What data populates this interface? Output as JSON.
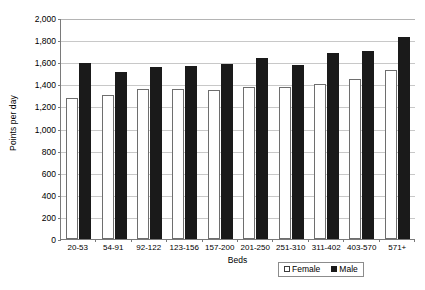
{
  "chart_data": {
    "type": "bar",
    "title": "",
    "xlabel": "Beds",
    "ylabel": "Points per day",
    "categories": [
      "20-53",
      "54-91",
      "92-122",
      "123-156",
      "157-200",
      "201-250",
      "251-310",
      "311-402",
      "403-570",
      "571+"
    ],
    "series": [
      {
        "name": "Female",
        "color": "#ffffff",
        "values": [
          1275,
          1300,
          1355,
          1355,
          1350,
          1375,
          1380,
          1400,
          1450,
          1530
        ]
      },
      {
        "name": "Male",
        "color": "#1a1a1a",
        "values": [
          1595,
          1515,
          1560,
          1565,
          1580,
          1640,
          1575,
          1680,
          1700,
          1830
        ]
      }
    ],
    "ylim": [
      0,
      2000
    ],
    "ytick_step": 200,
    "yticks": [
      "2,000",
      "1,800",
      "1,600",
      "1,400",
      "1,200",
      "1,000",
      "800",
      "600",
      "400",
      "200",
      "0"
    ],
    "grid": true,
    "legend_position": "bottom-right"
  },
  "legend": {
    "entries": [
      {
        "label": "Female",
        "swatch": "hollow-square"
      },
      {
        "label": "Male",
        "swatch": "filled-square"
      }
    ]
  }
}
